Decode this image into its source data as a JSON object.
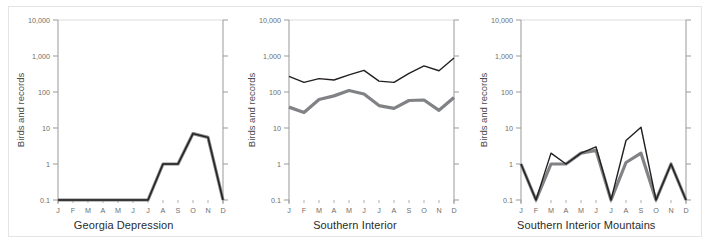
{
  "figure": {
    "ylabel": "Birds and records",
    "y_ticks": [
      "10,000",
      "1,000",
      "100",
      "10",
      "1",
      "0.1"
    ],
    "x_ticks": [
      "J",
      "F",
      "M",
      "A",
      "M",
      "J",
      "J",
      "A",
      "S",
      "O",
      "N",
      "D"
    ],
    "colors": {
      "line_black": "#231f20",
      "line_gray": "#808285",
      "axis": "#9a9a9a",
      "gridline": "#dcdcdc",
      "frame": "#e4e4e4",
      "tick_text": "#6e6e6e",
      "caption_text": "#2b2b2b"
    }
  },
  "chart_data": [
    {
      "type": "line",
      "title": "Georgia Depression",
      "xlabel": "",
      "ylabel": "Birds and records",
      "yscale": "log",
      "ylim": [
        0.1,
        10000
      ],
      "ytick_values": [
        10000,
        1000,
        100,
        10,
        1,
        0.1
      ],
      "grid": true,
      "legend": "none",
      "categories": [
        "J",
        "F",
        "M",
        "A",
        "M",
        "J",
        "J",
        "A",
        "S",
        "O",
        "N",
        "D"
      ],
      "series": [
        {
          "name": "records",
          "color": "#231f20",
          "values": [
            0.1,
            0.1,
            0.1,
            0.1,
            0.1,
            0.1,
            0.1,
            1,
            1,
            7,
            5.5,
            0.1
          ]
        },
        {
          "name": "birds",
          "color": "#808285",
          "values": [
            0.1,
            0.1,
            0.1,
            0.1,
            0.1,
            0.1,
            0.1,
            1,
            1,
            7,
            5.5,
            0.1
          ]
        }
      ]
    },
    {
      "type": "line",
      "title": "Southern Interior",
      "xlabel": "",
      "ylabel": "Birds and records",
      "yscale": "log",
      "ylim": [
        0.1,
        10000
      ],
      "ytick_values": [
        10000,
        1000,
        100,
        10,
        1,
        0.1
      ],
      "grid": true,
      "legend": "none",
      "categories": [
        "J",
        "F",
        "M",
        "A",
        "M",
        "J",
        "J",
        "A",
        "S",
        "O",
        "N",
        "D"
      ],
      "series": [
        {
          "name": "records",
          "color": "#231f20",
          "values": [
            270,
            185,
            235,
            215,
            300,
            400,
            200,
            185,
            330,
            530,
            390,
            880
          ]
        },
        {
          "name": "birds",
          "color": "#808285",
          "values": [
            38,
            27,
            62,
            78,
            110,
            88,
            42,
            35,
            58,
            60,
            31,
            70
          ]
        }
      ]
    },
    {
      "type": "line",
      "title": "Southern Interior Mountains",
      "xlabel": "",
      "ylabel": "Birds and records",
      "yscale": "log",
      "ylim": [
        0.1,
        10000
      ],
      "ytick_values": [
        10000,
        1000,
        100,
        10,
        1,
        0.1
      ],
      "grid": true,
      "legend": "none",
      "categories": [
        "J",
        "F",
        "M",
        "A",
        "M",
        "J",
        "J",
        "A",
        "S",
        "O",
        "N",
        "D"
      ],
      "series": [
        {
          "name": "records",
          "color": "#231f20",
          "values": [
            1,
            0.1,
            2,
            1,
            2,
            3,
            0.1,
            4.5,
            10.5,
            0.1,
            1,
            0.1
          ]
        },
        {
          "name": "birds",
          "color": "#808285",
          "values": [
            1,
            0.1,
            1,
            1,
            2,
            2.4,
            0.1,
            1.1,
            2,
            0.1,
            1,
            0.1
          ]
        }
      ]
    }
  ]
}
